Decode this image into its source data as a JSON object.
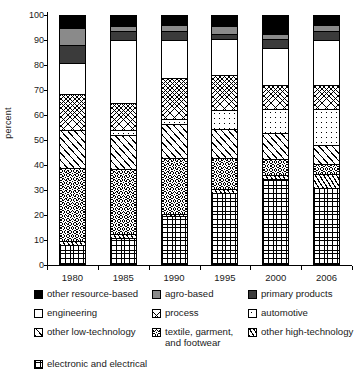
{
  "chart_data": {
    "type": "bar",
    "subtype": "stacked-100-percent",
    "title": "",
    "xlabel": "",
    "ylabel": "percent",
    "ylim": [
      0,
      100
    ],
    "yticks": [
      0,
      10,
      20,
      30,
      40,
      50,
      60,
      70,
      80,
      90,
      100
    ],
    "grid": false,
    "legend_position": "bottom",
    "categories": [
      "1980",
      "1985",
      "1990",
      "1995",
      "2000",
      "2006"
    ],
    "stack_order_bottom_to_top": [
      "electronic and electrical",
      "other high-technology",
      "textile, garment, and footwear",
      "other low-technology",
      "automotive",
      "process",
      "engineering",
      "primary products",
      "agro-based",
      "other resource-based"
    ],
    "series": [
      {
        "name": "electronic and electrical",
        "values": [
          8.0,
          11.0,
          19.5,
          29.0,
          34.5,
          31.0
        ]
      },
      {
        "name": "other high-technology",
        "values": [
          1.5,
          1.5,
          1.0,
          1.5,
          1.5,
          5.5
        ]
      },
      {
        "name": "textile, garment, and footwear",
        "values": [
          29.5,
          26.0,
          22.5,
          12.5,
          6.5,
          4.0
        ]
      },
      {
        "name": "other low-technology",
        "values": [
          15.0,
          13.5,
          13.5,
          11.5,
          10.5,
          7.5
        ]
      },
      {
        "name": "automotive",
        "values": [
          0.0,
          2.0,
          2.0,
          7.5,
          9.5,
          14.5
        ]
      },
      {
        "name": "process",
        "values": [
          14.5,
          11.0,
          16.5,
          14.0,
          9.5,
          9.5
        ]
      },
      {
        "name": "engineering",
        "values": [
          12.5,
          25.0,
          15.0,
          14.5,
          15.0,
          18.0
        ]
      },
      {
        "name": "primary products",
        "values": [
          7.0,
          3.5,
          3.5,
          2.0,
          3.5,
          3.5
        ]
      },
      {
        "name": "agro-based",
        "values": [
          7.0,
          2.0,
          2.5,
          3.0,
          2.0,
          2.5
        ]
      },
      {
        "name": "other resource-based",
        "values": [
          5.0,
          4.5,
          4.0,
          4.5,
          7.5,
          4.0
        ]
      }
    ]
  },
  "axis": {
    "ylabel": "percent",
    "yticks": [
      "100",
      "90",
      "80",
      "70",
      "60",
      "50",
      "40",
      "30",
      "20",
      "10",
      "0"
    ],
    "xlabels": [
      "1980",
      "1985",
      "1990",
      "1995",
      "2000",
      "2006"
    ]
  },
  "legend": {
    "items": [
      {
        "label": "other resource-based",
        "swatch": "solid-black-swatch",
        "fill": "f-black"
      },
      {
        "label": "agro-based",
        "swatch": "solid-gray-swatch",
        "fill": "f-agro"
      },
      {
        "label": "primary products",
        "swatch": "solid-dark-gray-swatch",
        "fill": "f-primary"
      },
      {
        "label": "engineering",
        "swatch": "white-swatch",
        "fill": "f-white"
      },
      {
        "label": "process",
        "swatch": "crosshatch-swatch",
        "fill": "f-process"
      },
      {
        "label": "automotive",
        "swatch": "dotted-swatch",
        "fill": "f-auto"
      },
      {
        "label": "other low-technology",
        "swatch": "wide-diagonal-swatch",
        "fill": "f-lowtech"
      },
      {
        "label": "textile, garment,\nand footwear",
        "swatch": "fine-crosshatch-swatch",
        "fill": "f-textile"
      },
      {
        "label": "other high-technology",
        "swatch": "narrow-diagonal-swatch",
        "fill": "f-hightech"
      },
      {
        "label": "electronic and electrical",
        "swatch": "checker-grid-swatch",
        "fill": "f-elec"
      }
    ]
  },
  "colors": {
    "other_resource_based": "#000000",
    "agro_based": "#8a8a8a",
    "primary_products": "#3b3b3b",
    "engineering": "#ffffff",
    "axis": "#000000"
  }
}
